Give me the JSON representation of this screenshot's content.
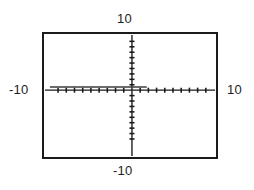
{
  "view": {
    "title": "",
    "top_label": "10",
    "bottom_label": "-10",
    "left_label": "-10",
    "right_label": "10"
  },
  "chart_data": {
    "type": "line",
    "title": "",
    "xlabel": "",
    "ylabel": "",
    "xlim": [
      -10,
      10
    ],
    "ylim": [
      -10,
      10
    ],
    "xticks": [
      -9,
      -8,
      -7,
      -6,
      -5,
      -4,
      -3,
      -2,
      -1,
      1,
      2,
      3,
      4,
      5,
      6,
      7,
      8,
      9
    ],
    "yticks": [
      -9,
      -8,
      -7,
      -6,
      -5,
      -4,
      -3,
      -2,
      -1,
      1,
      2,
      3,
      4,
      5,
      6,
      7,
      8,
      9
    ],
    "tick_interval": 1,
    "grid": false,
    "legend": "none",
    "axes": {
      "x_axis_y": 0,
      "y_axis_x": 0,
      "x_axis_visible": true,
      "y_axis_visible": true
    },
    "series": [
      {
        "name": "horizontal constant line",
        "type": "line",
        "color": "#3c3c3c",
        "x": [
          -10,
          1.8
        ],
        "y": [
          0.6,
          0.6
        ],
        "x_start": -10,
        "x_end": 1.8,
        "y_value": 0.6,
        "note": "flat segment slightly above the x-axis, terminating to the right of the y-axis"
      }
    ],
    "tick_labels_shown": [
      "10",
      "-10",
      "-10",
      "10"
    ]
  },
  "colors": {
    "frame": "#1b1b1b",
    "axis": "#1a1a1a",
    "tick": "#1a1a1a",
    "curve": "#3c3c3c",
    "background": "#ffffff",
    "text": "#1d1d1d"
  }
}
